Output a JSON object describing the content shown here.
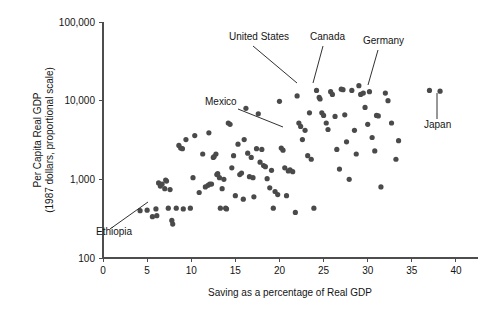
{
  "figure": {
    "background_color": "#ffffff",
    "point_color": "#4a4a4a",
    "axis_color": "#4d4d4d",
    "text_color": "#141414"
  },
  "chart_data": {
    "type": "scatter",
    "title": "",
    "subtitle": "",
    "xlabel": "Saving as a percentage of Real GDP",
    "ylabel_line1": "Per Capita Real GDP",
    "ylabel_line2": "(1987 dollars, proportional scale)",
    "grid": false,
    "legend": null,
    "xscale": "linear",
    "yscale": "log",
    "xlim": [
      0,
      42.5
    ],
    "ylim": [
      100,
      100000
    ],
    "xticks": [
      0,
      5,
      10,
      15,
      20,
      25,
      30,
      35,
      40
    ],
    "xticklabels": [
      "0",
      "5",
      "10",
      "15",
      "20",
      "25",
      "30",
      "35",
      "40"
    ],
    "yticks": [
      100,
      1000,
      10000,
      100000
    ],
    "yticklabels": [
      "100",
      "1,000",
      "10,000",
      "100,000"
    ],
    "series": [
      {
        "name": "countries",
        "points": [
          [
            4.2,
            400
          ],
          [
            5.0,
            405
          ],
          [
            5.6,
            335
          ],
          [
            6.0,
            420
          ],
          [
            6.1,
            345
          ],
          [
            6.3,
            900
          ],
          [
            6.5,
            820
          ],
          [
            6.7,
            870
          ],
          [
            7.0,
            760
          ],
          [
            7.1,
            980
          ],
          [
            7.2,
            950
          ],
          [
            7.4,
            430
          ],
          [
            7.6,
            740
          ],
          [
            7.8,
            300
          ],
          [
            7.9,
            270
          ],
          [
            8.3,
            430
          ],
          [
            8.6,
            2700
          ],
          [
            8.8,
            2500
          ],
          [
            9.0,
            2450
          ],
          [
            9.1,
            420
          ],
          [
            9.4,
            3200
          ],
          [
            9.9,
            430
          ],
          [
            10.2,
            1050
          ],
          [
            10.4,
            3600
          ],
          [
            10.9,
            680
          ],
          [
            11.3,
            2100
          ],
          [
            11.6,
            800
          ],
          [
            11.9,
            840
          ],
          [
            12.0,
            3900
          ],
          [
            12.1,
            870
          ],
          [
            12.3,
            870
          ],
          [
            12.5,
            1900
          ],
          [
            12.6,
            1950
          ],
          [
            12.8,
            2100
          ],
          [
            12.9,
            1150
          ],
          [
            13.0,
            1180
          ],
          [
            13.2,
            1050
          ],
          [
            13.3,
            430
          ],
          [
            13.5,
            760
          ],
          [
            13.7,
            1000
          ],
          [
            13.9,
            430
          ],
          [
            14.0,
            420
          ],
          [
            14.2,
            5200
          ],
          [
            14.4,
            5000
          ],
          [
            14.6,
            1400
          ],
          [
            14.8,
            2000
          ],
          [
            15.0,
            620
          ],
          [
            15.3,
            2800
          ],
          [
            15.5,
            1150
          ],
          [
            15.7,
            1200
          ],
          [
            15.9,
            560
          ],
          [
            16.0,
            3200
          ],
          [
            16.2,
            8000
          ],
          [
            16.4,
            2150
          ],
          [
            16.6,
            1080
          ],
          [
            16.8,
            1900
          ],
          [
            17.0,
            1050
          ],
          [
            17.1,
            600
          ],
          [
            17.4,
            2450
          ],
          [
            17.6,
            6800
          ],
          [
            17.8,
            1650
          ],
          [
            18.0,
            2400
          ],
          [
            18.2,
            1500
          ],
          [
            18.4,
            1450
          ],
          [
            18.6,
            1020
          ],
          [
            18.9,
            780
          ],
          [
            19.1,
            1300
          ],
          [
            19.3,
            430
          ],
          [
            19.5,
            700
          ],
          [
            19.8,
            640
          ],
          [
            20.0,
            9800
          ],
          [
            20.2,
            2500
          ],
          [
            20.4,
            2350
          ],
          [
            20.6,
            1400
          ],
          [
            20.8,
            620
          ],
          [
            21.0,
            1280
          ],
          [
            21.2,
            1320
          ],
          [
            21.5,
            1250
          ],
          [
            21.8,
            380
          ],
          [
            22.0,
            11500
          ],
          [
            22.2,
            5200
          ],
          [
            22.4,
            4700
          ],
          [
            22.6,
            3200
          ],
          [
            22.9,
            4200
          ],
          [
            23.2,
            2000
          ],
          [
            23.4,
            7000
          ],
          [
            23.6,
            1800
          ],
          [
            23.9,
            430
          ],
          [
            24.2,
            13500
          ],
          [
            24.5,
            11000
          ],
          [
            24.6,
            10500
          ],
          [
            24.8,
            7000
          ],
          [
            25.0,
            6500
          ],
          [
            25.3,
            5200
          ],
          [
            25.5,
            4300
          ],
          [
            25.8,
            13000
          ],
          [
            26.0,
            12000
          ],
          [
            26.3,
            6300
          ],
          [
            26.5,
            2400
          ],
          [
            26.8,
            1350
          ],
          [
            27.0,
            14000
          ],
          [
            27.2,
            13800
          ],
          [
            27.4,
            6600
          ],
          [
            27.6,
            3000
          ],
          [
            27.9,
            1000
          ],
          [
            28.2,
            13500
          ],
          [
            28.5,
            4200
          ],
          [
            28.7,
            2100
          ],
          [
            29.0,
            15500
          ],
          [
            29.2,
            12000
          ],
          [
            29.5,
            12500
          ],
          [
            29.7,
            8200
          ],
          [
            30.0,
            5000
          ],
          [
            30.2,
            13000
          ],
          [
            30.5,
            3400
          ],
          [
            30.8,
            2300
          ],
          [
            31.0,
            6500
          ],
          [
            31.2,
            6400
          ],
          [
            31.5,
            800
          ],
          [
            32.0,
            12500
          ],
          [
            32.3,
            10000
          ],
          [
            32.7,
            5200
          ],
          [
            33.2,
            1800
          ],
          [
            33.5,
            3100
          ],
          [
            37.0,
            13500
          ],
          [
            38.2,
            13200
          ]
        ]
      }
    ],
    "annotations": [
      {
        "label": "Ethiopia",
        "text_x": 96,
        "text_y": 235,
        "anchor": "start",
        "leader": [
          [
            110,
            229
          ],
          [
            148,
            202
          ]
        ]
      },
      {
        "label": "Mexico",
        "text_x": 205,
        "text_y": 105,
        "anchor": "start",
        "leader": [
          [
            238,
            109
          ],
          [
            283,
            127
          ]
        ]
      },
      {
        "label": "United States",
        "text_x": 229,
        "text_y": 40,
        "anchor": "start",
        "leader": [
          [
            253,
            46
          ],
          [
            297,
            83
          ]
        ]
      },
      {
        "label": "Canada",
        "text_x": 310,
        "text_y": 40,
        "anchor": "start",
        "leader": [
          [
            323,
            46
          ],
          [
            313,
            83
          ]
        ]
      },
      {
        "label": "Germany",
        "text_x": 363,
        "text_y": 44,
        "anchor": "start",
        "leader": [
          [
            378,
            50
          ],
          [
            368,
            85
          ]
        ]
      },
      {
        "label": "Japan",
        "text_x": 424,
        "text_y": 128,
        "anchor": "start",
        "leader": [
          [
            437,
            119
          ],
          [
            437,
            93
          ]
        ]
      }
    ]
  }
}
